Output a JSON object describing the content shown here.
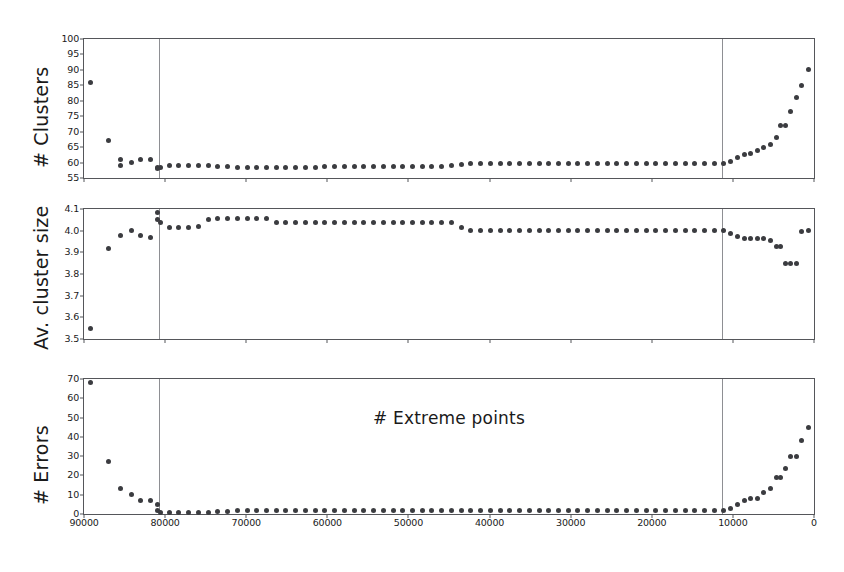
{
  "figure": {
    "xlabel": "# Extreme points",
    "background": "#ffffff",
    "marker_color": "#3b3c40",
    "axis_color": "#55565a",
    "vline_color": "#8e8f93"
  },
  "chart_data": [
    {
      "type": "scatter",
      "panel_index": 0,
      "title": "",
      "xlabel": "",
      "ylabel": "# Clusters",
      "xlim": [
        90000,
        0
      ],
      "ylim": [
        55,
        100
      ],
      "x_inverted": true,
      "grid": false,
      "legend": null,
      "xticks": [
        90000,
        80000,
        70000,
        60000,
        50000,
        40000,
        30000,
        20000,
        10000,
        0
      ],
      "xticklabels": [
        "90000",
        "80000",
        "70000",
        "60000",
        "50000",
        "40000",
        "30000",
        "20000",
        "10000",
        "0"
      ],
      "yticks": [
        55,
        60,
        65,
        70,
        75,
        80,
        85,
        90,
        95,
        100
      ],
      "yticklabels": [
        "55",
        "60",
        "65",
        "70",
        "75",
        "80",
        "85",
        "90",
        "95",
        "100"
      ],
      "annotations": [
        {
          "type": "vline",
          "x": 80800
        },
        {
          "type": "vline",
          "x": 11400
        }
      ],
      "x": [
        89200,
        87000,
        85500,
        85500,
        84200,
        83000,
        81800,
        81000,
        81000,
        80600,
        79500,
        78300,
        77100,
        75900,
        74700,
        73500,
        72300,
        71100,
        69900,
        68700,
        67500,
        66300,
        65100,
        63900,
        62700,
        61500,
        60300,
        59100,
        57900,
        56700,
        55500,
        54300,
        53100,
        51900,
        50700,
        49500,
        48300,
        47100,
        45900,
        44700,
        43500,
        42300,
        41100,
        39900,
        38700,
        37500,
        36300,
        35100,
        33900,
        32700,
        31500,
        30300,
        29100,
        27900,
        26700,
        25500,
        24300,
        23100,
        21900,
        20700,
        19500,
        18300,
        17100,
        15900,
        14700,
        13500,
        12300,
        11100,
        10300,
        9400,
        8600,
        7800,
        7000,
        6200,
        5400,
        4600,
        4100,
        3500,
        2900,
        2200,
        1500,
        700
      ],
      "y": [
        86,
        67,
        61,
        59,
        60,
        61,
        61,
        58.5,
        58,
        58.5,
        59,
        59,
        59,
        59,
        59,
        58.8,
        58.6,
        58.5,
        58.4,
        58.4,
        58.4,
        58.4,
        58.4,
        58.4,
        58.4,
        58.4,
        58.6,
        58.6,
        58.6,
        58.6,
        58.6,
        58.6,
        58.8,
        58.8,
        58.8,
        58.8,
        58.8,
        58.8,
        58.8,
        59,
        59.4,
        59.6,
        59.8,
        59.8,
        59.8,
        59.8,
        59.8,
        59.8,
        59.8,
        59.8,
        59.8,
        59.8,
        59.8,
        59.8,
        59.8,
        59.8,
        59.8,
        59.8,
        59.8,
        59.8,
        59.8,
        59.8,
        59.8,
        59.8,
        59.8,
        59.8,
        59.8,
        59.8,
        60.5,
        61.5,
        62.5,
        63,
        64,
        65,
        66,
        68,
        72,
        72,
        76.5,
        81,
        85,
        90,
        98
      ]
    },
    {
      "type": "scatter",
      "panel_index": 1,
      "title": "",
      "xlabel": "",
      "ylabel": "Av. cluster size",
      "xlim": [
        90000,
        0
      ],
      "ylim": [
        3.5,
        4.1
      ],
      "x_inverted": true,
      "grid": false,
      "legend": null,
      "xticks": [
        90000,
        80000,
        70000,
        60000,
        50000,
        40000,
        30000,
        20000,
        10000,
        0
      ],
      "xticklabels": [
        "90000",
        "80000",
        "70000",
        "60000",
        "50000",
        "40000",
        "30000",
        "20000",
        "10000",
        "0"
      ],
      "yticks": [
        3.5,
        3.6,
        3.7,
        3.8,
        3.9,
        4.0,
        4.1
      ],
      "yticklabels": [
        "3.5",
        "3.6",
        "3.7",
        "3.8",
        "3.9",
        "4.0",
        "4.1"
      ],
      "annotations": [
        {
          "type": "vline",
          "x": 80800
        },
        {
          "type": "vline",
          "x": 11400
        }
      ],
      "x": [
        89200,
        87000,
        85500,
        84200,
        83000,
        81800,
        81000,
        81000,
        80600,
        79500,
        78300,
        77100,
        75900,
        74700,
        73500,
        72300,
        71100,
        69900,
        68700,
        67500,
        66300,
        65100,
        63900,
        62700,
        61500,
        60300,
        59100,
        57900,
        56700,
        55500,
        54300,
        53100,
        51900,
        50700,
        49500,
        48300,
        47100,
        45900,
        44700,
        43500,
        42300,
        41100,
        39900,
        38700,
        37500,
        36300,
        35100,
        33900,
        32700,
        31500,
        30300,
        29100,
        27900,
        26700,
        25500,
        24300,
        23100,
        21900,
        20700,
        19500,
        18300,
        17100,
        15900,
        14700,
        13500,
        12300,
        11100,
        10300,
        9400,
        8600,
        7800,
        7000,
        6200,
        5400,
        4600,
        4100,
        3500,
        2900,
        2200,
        1500,
        700
      ],
      "y": [
        3.55,
        3.92,
        3.98,
        4.0,
        3.98,
        3.97,
        4.085,
        4.05,
        4.04,
        4.015,
        4.015,
        4.015,
        4.02,
        4.05,
        4.055,
        4.055,
        4.055,
        4.055,
        4.055,
        4.055,
        4.04,
        4.04,
        4.04,
        4.04,
        4.04,
        4.04,
        4.04,
        4.04,
        4.04,
        4.04,
        4.04,
        4.04,
        4.04,
        4.04,
        4.04,
        4.04,
        4.04,
        4.04,
        4.04,
        4.015,
        4.0,
        4.0,
        4.0,
        4.0,
        4.0,
        4.0,
        4.0,
        4.0,
        4.0,
        4.0,
        4.0,
        4.0,
        4.0,
        4.0,
        4.0,
        4.0,
        4.0,
        4.0,
        4.0,
        4.0,
        4.0,
        4.0,
        4.0,
        4.0,
        4.0,
        4.0,
        4.0,
        3.985,
        3.975,
        3.965,
        3.965,
        3.965,
        3.965,
        3.955,
        3.925,
        3.925,
        3.85,
        3.85,
        3.85,
        3.995,
        4.0
      ]
    },
    {
      "type": "scatter",
      "panel_index": 2,
      "title": "",
      "xlabel": "# Extreme points",
      "ylabel": "# Errors",
      "xlim": [
        90000,
        0
      ],
      "ylim": [
        0,
        70
      ],
      "x_inverted": true,
      "grid": false,
      "legend": null,
      "xticks": [
        90000,
        80000,
        70000,
        60000,
        50000,
        40000,
        30000,
        20000,
        10000,
        0
      ],
      "xticklabels": [
        "90000",
        "80000",
        "70000",
        "60000",
        "50000",
        "40000",
        "30000",
        "20000",
        "10000",
        "0"
      ],
      "yticks": [
        0,
        10,
        20,
        30,
        40,
        50,
        60,
        70
      ],
      "yticklabels": [
        "0",
        "10",
        "20",
        "30",
        "40",
        "50",
        "60",
        "70"
      ],
      "annotations": [
        {
          "type": "vline",
          "x": 80800
        },
        {
          "type": "vline",
          "x": 11400
        }
      ],
      "x": [
        89200,
        87000,
        85500,
        84200,
        83000,
        81800,
        81000,
        81000,
        80600,
        79500,
        78300,
        77100,
        75900,
        74700,
        73500,
        72300,
        71100,
        69900,
        68700,
        67500,
        66300,
        65100,
        63900,
        62700,
        61500,
        60300,
        59100,
        57900,
        56700,
        55500,
        54300,
        53100,
        51900,
        50700,
        49500,
        48300,
        47100,
        45900,
        44700,
        43500,
        42300,
        41100,
        39900,
        38700,
        37500,
        36300,
        35100,
        33900,
        32700,
        31500,
        30300,
        29100,
        27900,
        26700,
        25500,
        24300,
        23100,
        21900,
        20700,
        19500,
        18300,
        17100,
        15900,
        14700,
        13500,
        12300,
        11100,
        10300,
        9400,
        8600,
        7800,
        7000,
        6200,
        5400,
        4600,
        4100,
        3500,
        2900,
        2200,
        1500,
        700
      ],
      "y": [
        68,
        27,
        13,
        10,
        7,
        7,
        5,
        2,
        1,
        1,
        1,
        1,
        1,
        1,
        1.5,
        1.5,
        2,
        2,
        2,
        2,
        2,
        2,
        2,
        2,
        2,
        2,
        2,
        2,
        2,
        2,
        2,
        2,
        2,
        2,
        2,
        2,
        2,
        2,
        2,
        2,
        2,
        2,
        2,
        2,
        2,
        2,
        2,
        2,
        2,
        2,
        2,
        2,
        2,
        2,
        2,
        2,
        2,
        2,
        2,
        2,
        2,
        2,
        2,
        2,
        2,
        2,
        2,
        3,
        5,
        7,
        8,
        8,
        11,
        13,
        19,
        19,
        23.5,
        30,
        30,
        38,
        45,
        58
      ]
    }
  ]
}
